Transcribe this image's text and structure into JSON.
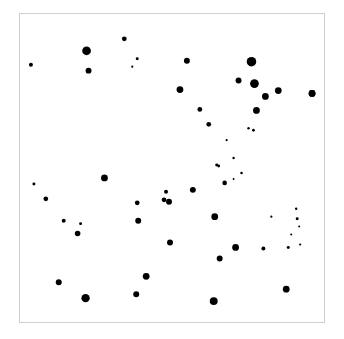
{
  "figure": {
    "background_color": "#ffffff",
    "width": 344,
    "height": 339
  },
  "plot_frame": {
    "x": 19,
    "y": 13,
    "width": 306,
    "height": 310,
    "border_color": "#cfcfcf",
    "border_width": 1,
    "fill_color": "#ffffff"
  },
  "chart_data": {
    "type": "scatter",
    "title": "",
    "subtitle": "",
    "xlabel": "",
    "ylabel": "",
    "grid": false,
    "legend": null,
    "axis_ticks_visible": false,
    "axis_tick_labels": [],
    "marker_color": "#000000",
    "marker_shape": "circle",
    "xlim": [
      0,
      306
    ],
    "ylim": [
      0,
      310
    ],
    "x_axis_note": "pixel coordinates measured inside plot frame, origin at frame top-left",
    "point_count": 57,
    "points": [
      {
        "x": 67,
        "y": 37,
        "r": 4.4
      },
      {
        "x": 69,
        "y": 57,
        "r": 3.0
      },
      {
        "x": 105,
        "y": 25,
        "r": 2.4
      },
      {
        "x": 11,
        "y": 51,
        "r": 2.0
      },
      {
        "x": 118,
        "y": 45,
        "r": 1.5
      },
      {
        "x": 113,
        "y": 53,
        "r": 1.1
      },
      {
        "x": 168,
        "y": 47,
        "r": 3.0
      },
      {
        "x": 233,
        "y": 48,
        "r": 4.8
      },
      {
        "x": 220,
        "y": 67,
        "r": 3.0
      },
      {
        "x": 236,
        "y": 70,
        "r": 4.4
      },
      {
        "x": 161,
        "y": 76,
        "r": 3.4
      },
      {
        "x": 247,
        "y": 83,
        "r": 3.4
      },
      {
        "x": 260,
        "y": 77,
        "r": 3.4
      },
      {
        "x": 294,
        "y": 80,
        "r": 3.4
      },
      {
        "x": 181,
        "y": 96,
        "r": 2.4
      },
      {
        "x": 238,
        "y": 97,
        "r": 3.4
      },
      {
        "x": 190,
        "y": 111,
        "r": 2.4
      },
      {
        "x": 230,
        "y": 115,
        "r": 1.2
      },
      {
        "x": 235,
        "y": 117,
        "r": 1.4
      },
      {
        "x": 208,
        "y": 127,
        "r": 1.1
      },
      {
        "x": 198,
        "y": 152,
        "r": 1.5
      },
      {
        "x": 215,
        "y": 166,
        "r": 1.0
      },
      {
        "x": 206,
        "y": 170,
        "r": 2.3
      },
      {
        "x": 85,
        "y": 165,
        "r": 3.4
      },
      {
        "x": 14,
        "y": 171,
        "r": 1.5
      },
      {
        "x": 26,
        "y": 186,
        "r": 2.4
      },
      {
        "x": 174,
        "y": 177,
        "r": 3.0
      },
      {
        "x": 147,
        "y": 179,
        "r": 2.0
      },
      {
        "x": 145,
        "y": 187,
        "r": 2.4
      },
      {
        "x": 150,
        "y": 189,
        "r": 3.0
      },
      {
        "x": 118,
        "y": 190,
        "r": 2.4
      },
      {
        "x": 119,
        "y": 208,
        "r": 3.0
      },
      {
        "x": 44,
        "y": 208,
        "r": 2.0
      },
      {
        "x": 61,
        "y": 211,
        "r": 1.5
      },
      {
        "x": 58,
        "y": 221,
        "r": 2.8
      },
      {
        "x": 279,
        "y": 206,
        "r": 1.5
      },
      {
        "x": 281,
        "y": 214,
        "r": 1.0
      },
      {
        "x": 196,
        "y": 204,
        "r": 3.4
      },
      {
        "x": 151,
        "y": 230,
        "r": 3.0
      },
      {
        "x": 217,
        "y": 235,
        "r": 3.4
      },
      {
        "x": 245,
        "y": 236,
        "r": 2.0
      },
      {
        "x": 270,
        "y": 235,
        "r": 1.5
      },
      {
        "x": 201,
        "y": 246,
        "r": 3.0
      },
      {
        "x": 127,
        "y": 264,
        "r": 3.4
      },
      {
        "x": 39,
        "y": 270,
        "r": 3.0
      },
      {
        "x": 268,
        "y": 277,
        "r": 3.4
      },
      {
        "x": 117,
        "y": 282,
        "r": 3.0
      },
      {
        "x": 66,
        "y": 286,
        "r": 4.2
      },
      {
        "x": 195,
        "y": 289,
        "r": 4.0
      },
      {
        "x": 294,
        "y": 80,
        "r": 3.4
      },
      {
        "x": 200,
        "y": 153,
        "r": 1.4
      },
      {
        "x": 215,
        "y": 145,
        "r": 1.2
      },
      {
        "x": 253,
        "y": 204,
        "r": 1.1
      },
      {
        "x": 278,
        "y": 196,
        "r": 1.2
      },
      {
        "x": 282,
        "y": 232,
        "r": 1.1
      },
      {
        "x": 273,
        "y": 222,
        "r": 1.0
      },
      {
        "x": 223,
        "y": 160,
        "r": 1.3
      }
    ]
  }
}
